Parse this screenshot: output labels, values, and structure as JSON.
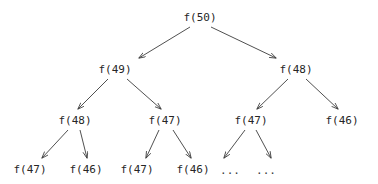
{
  "diagram": {
    "type": "recursion-tree",
    "title": "",
    "background_color": "#ffffff",
    "text_color": "#262626",
    "edge_color": "#3c3c3c",
    "levels": [
      {
        "index": 0,
        "nodes": [
          {
            "id": "n0",
            "label": "f(50)",
            "x": 200,
            "y": 18
          }
        ]
      },
      {
        "index": 1,
        "nodes": [
          {
            "id": "n1",
            "label": "f(49)",
            "x": 115,
            "y": 70
          },
          {
            "id": "n2",
            "label": "f(48)",
            "x": 296,
            "y": 70
          }
        ]
      },
      {
        "index": 2,
        "nodes": [
          {
            "id": "n3",
            "label": "f(48)",
            "x": 75,
            "y": 121
          },
          {
            "id": "n4",
            "label": "f(47)",
            "x": 165,
            "y": 121
          },
          {
            "id": "n5",
            "label": "f(47)",
            "x": 251,
            "y": 121
          },
          {
            "id": "n6",
            "label": "f(46)",
            "x": 342,
            "y": 121
          }
        ]
      },
      {
        "index": 3,
        "nodes": [
          {
            "id": "n7",
            "label": "f(47)",
            "x": 30,
            "y": 170
          },
          {
            "id": "n8",
            "label": "f(46)",
            "x": 86,
            "y": 170
          },
          {
            "id": "n9",
            "label": "f(47)",
            "x": 137,
            "y": 170
          },
          {
            "id": "n10",
            "label": "f(46)",
            "x": 193,
            "y": 170
          },
          {
            "id": "n11",
            "label": "...",
            "x": 230,
            "y": 171
          },
          {
            "id": "n12",
            "label": "...",
            "x": 266,
            "y": 171
          }
        ]
      }
    ],
    "edges": [
      {
        "from": "n0",
        "to": "n1",
        "x1": 190,
        "y1": 27,
        "x2": 139,
        "y2": 58
      },
      {
        "from": "n0",
        "to": "n2",
        "x1": 211,
        "y1": 27,
        "x2": 276,
        "y2": 58
      },
      {
        "from": "n1",
        "to": "n3",
        "x1": 108,
        "y1": 79,
        "x2": 78,
        "y2": 109
      },
      {
        "from": "n1",
        "to": "n4",
        "x1": 127,
        "y1": 79,
        "x2": 161,
        "y2": 109
      },
      {
        "from": "n2",
        "to": "n5",
        "x1": 288,
        "y1": 79,
        "x2": 257,
        "y2": 109
      },
      {
        "from": "n2",
        "to": "n6",
        "x1": 306,
        "y1": 79,
        "x2": 338,
        "y2": 109
      },
      {
        "from": "n3",
        "to": "n7",
        "x1": 68,
        "y1": 130,
        "x2": 42,
        "y2": 158
      },
      {
        "from": "n3",
        "to": "n8",
        "x1": 80,
        "y1": 130,
        "x2": 87,
        "y2": 158
      },
      {
        "from": "n4",
        "to": "n9",
        "x1": 159,
        "y1": 130,
        "x2": 146,
        "y2": 158
      },
      {
        "from": "n4",
        "to": "n10",
        "x1": 173,
        "y1": 130,
        "x2": 191,
        "y2": 158
      },
      {
        "from": "n5",
        "to": "n11",
        "x1": 245,
        "y1": 130,
        "x2": 224,
        "y2": 158
      },
      {
        "from": "n5",
        "to": "n12",
        "x1": 256,
        "y1": 130,
        "x2": 271,
        "y2": 158
      }
    ]
  }
}
